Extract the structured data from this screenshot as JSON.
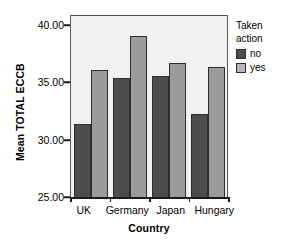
{
  "chart_data": {
    "type": "bar",
    "title": "",
    "xlabel": "Country",
    "ylabel": "Mean TOTAL ECCB",
    "categories": [
      "UK",
      "Germany",
      "Japan",
      "Hungary"
    ],
    "ylim": [
      25.0,
      40.0
    ],
    "yticks": [
      "25.00",
      "30.00",
      "35.00",
      "40.00"
    ],
    "grid": false,
    "legend_position": "right",
    "legend_title": "Taken action",
    "series": [
      {
        "name": "no",
        "color": "#4d4d4d",
        "values": [
          31.1,
          34.9,
          35.1,
          31.9
        ]
      },
      {
        "name": "yes",
        "color": "#9b9b9b",
        "values": [
          35.6,
          38.4,
          36.2,
          35.8
        ]
      }
    ]
  },
  "axes": {
    "ylabel": "Mean TOTAL ECCB",
    "xlabel": "Country",
    "ytick_labels": [
      "40.00",
      "35.00",
      "30.00",
      "25.00"
    ],
    "xtick_labels": [
      "UK",
      "Germany",
      "Japan",
      "Hungary"
    ]
  },
  "legend": {
    "title_line1": "Taken",
    "title_line2": "action",
    "items": [
      {
        "label": "no"
      },
      {
        "label": "yes"
      }
    ]
  }
}
